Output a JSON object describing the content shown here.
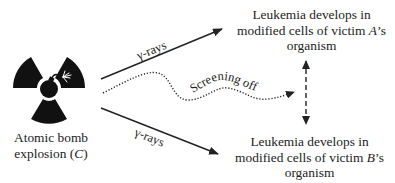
{
  "diagram": {
    "type": "causal-diagram",
    "source": {
      "icon": "radiation-bomb-icon",
      "label_line1": "Atomic bomb",
      "label_line2_prefix": "explosion (",
      "label_line2_var": "C",
      "label_line2_suffix": ")"
    },
    "effects": [
      {
        "id": "victim-a",
        "line1": "Leukemia develops in",
        "line2_prefix": "modified cells of victim ",
        "line2_var": "A",
        "line2_suffix": "’s",
        "line3": "organism"
      },
      {
        "id": "victim-b",
        "line1": "Leukemia develops in",
        "line2_prefix": "modified cells of victim ",
        "line2_var": "B",
        "line2_suffix": "’s",
        "line3": "organism"
      }
    ],
    "edges": [
      {
        "from": "source",
        "to": "victim-a",
        "style": "solid-arrow",
        "label": "γ-rays"
      },
      {
        "from": "source",
        "to": "victim-b",
        "style": "solid-arrow",
        "label": "γ-rays"
      },
      {
        "from": "source",
        "to": "correlation",
        "style": "dotted-wavy-arrow",
        "label": "Screening off"
      },
      {
        "from": "victim-a",
        "to": "victim-b",
        "style": "dashed-double-arrow",
        "label": ""
      }
    ],
    "colors": {
      "ink": "#222222",
      "background": "#ffffff"
    }
  }
}
